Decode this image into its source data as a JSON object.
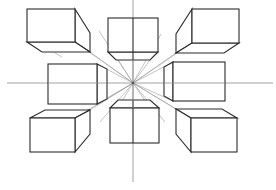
{
  "diagram": {
    "colors": {
      "background": "#ffffff",
      "box_edge": "#2b2b2b",
      "guide_line": "#8c8c8c",
      "orthogonal_line": "#9a9a9a"
    },
    "horizon_line": {
      "x1": 7,
      "y1": 83,
      "x2": 273,
      "y2": 83
    },
    "vertical_line": {
      "x1": 133,
      "y1": 0,
      "x2": 133,
      "y2": 182
    },
    "vanishing_point": {
      "x": 133,
      "y": 83
    },
    "boxes": [
      {
        "id": "top-left",
        "front": [
          27,
          9,
          75,
          42
        ]
      },
      {
        "id": "top-center",
        "front": [
          108,
          18,
          158,
          52
        ]
      },
      {
        "id": "top-right",
        "front": [
          192,
          9,
          239,
          43
        ]
      },
      {
        "id": "middle-left",
        "front": [
          48,
          64,
          97,
          104
        ]
      },
      {
        "id": "middle-right",
        "front": [
          173,
          62,
          225,
          101
        ]
      },
      {
        "id": "bottom-left",
        "front": [
          30,
          118,
          75,
          152
        ]
      },
      {
        "id": "bottom-center",
        "front": [
          110,
          108,
          159,
          143
        ]
      },
      {
        "id": "bottom-right",
        "front": [
          191,
          118,
          237,
          152
        ]
      }
    ]
  }
}
